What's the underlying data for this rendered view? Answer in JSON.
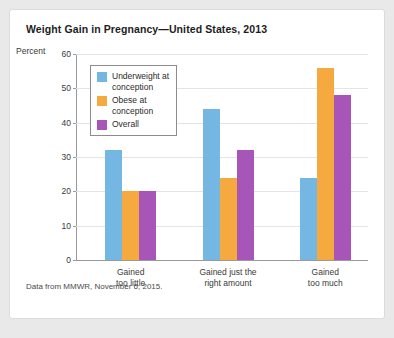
{
  "card": {
    "title": "Weight Gain in Pregnancy—United States, 2013",
    "source_note": "Data from MMWR, November 6, 2015."
  },
  "chart_data": {
    "type": "bar",
    "title": "Weight Gain in Pregnancy—United States, 2013",
    "xlabel": "",
    "ylabel": "Percent",
    "ylim": [
      0,
      60
    ],
    "yticks": [
      0,
      10,
      20,
      30,
      40,
      50,
      60
    ],
    "grid": true,
    "legend_position": "top-left inside plot",
    "categories": [
      "Gained\ntoo little",
      "Gained just the\nright amount",
      "Gained\ntoo much"
    ],
    "series": [
      {
        "name": "Underweight at\nconception",
        "color": "#74b7e2",
        "values": [
          32,
          44,
          24
        ]
      },
      {
        "name": "Obese at\nconception",
        "color": "#f5a93f",
        "values": [
          20,
          24,
          56
        ]
      },
      {
        "name": "Overall",
        "color": "#a855b8",
        "values": [
          20,
          32,
          48
        ]
      }
    ],
    "annotations": [
      "Data from MMWR, November 6, 2015."
    ]
  }
}
